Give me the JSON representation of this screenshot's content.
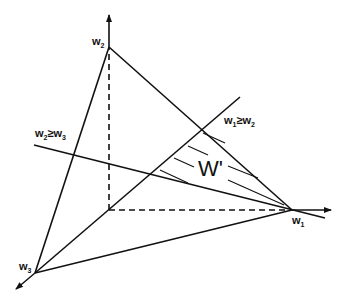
{
  "diagram": {
    "type": "geometric-simplex",
    "colors": {
      "stroke": "#111111",
      "background": "#ffffff"
    },
    "vertices": {
      "w1": {
        "label": "w",
        "sub": "1"
      },
      "w2": {
        "label": "w",
        "sub": "2"
      },
      "w3": {
        "label": "w",
        "sub": "3"
      }
    },
    "constraints": [
      {
        "id": "w1_ge_w2",
        "a": "w",
        "a_sub": "1",
        "op": "≥",
        "b": "w",
        "b_sub": "2"
      },
      {
        "id": "w2_ge_w3",
        "a": "w",
        "a_sub": "2",
        "op": "≥",
        "b": "w",
        "b_sub": "3"
      }
    ],
    "region": {
      "label": "W'"
    },
    "axes": [
      "w1 axis (horizontal, dashed to vertex)",
      "w2 axis (vertical, dashed to vertex)",
      "w3 axis (diagonal toward viewer)"
    ]
  }
}
